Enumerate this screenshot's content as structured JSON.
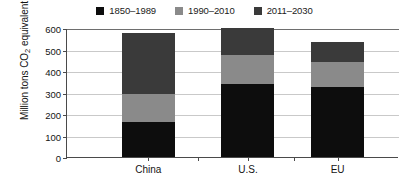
{
  "chart_data": {
    "type": "bar",
    "title": "",
    "subtitle": "",
    "xlabel": "",
    "ylabel": "Million tons CO2 equivalent",
    "ylabel_prefix": "Million tons CO",
    "ylabel_subscript": "2",
    "ylabel_suffix": " equivalent",
    "categories": [
      "China",
      "U.S.",
      "EU"
    ],
    "series": [
      {
        "name": "1850–1989",
        "color": "#0d0d0d",
        "values": [
          165,
          340,
          325
        ]
      },
      {
        "name": "1990–2010",
        "color": "#8a8a8a",
        "values": [
          130,
          135,
          115
        ]
      },
      {
        "name": "2011–2030",
        "color": "#3a3a3a",
        "values": [
          280,
          125,
          97
        ]
      }
    ],
    "totals": [
      575,
      600,
      537
    ],
    "stacked": true,
    "ylim": [
      0,
      600
    ],
    "yticks": [
      0,
      100,
      200,
      300,
      400,
      500,
      600
    ],
    "ytick_labels": [
      "0",
      "100",
      "200",
      "300",
      "400",
      "500",
      "600"
    ],
    "grid": true,
    "grid_axis": "y",
    "legend_position": "top-center",
    "legend": [
      "1850–1989",
      "1990–2010",
      "2011–2030"
    ],
    "colors": {
      "series_1": "#0d0d0d",
      "series_2": "#8a8a8a",
      "series_3": "#3a3a3a",
      "gridline": "#c9c9c9",
      "axis": "#4a4a4a",
      "text": "#141414",
      "background": "#ffffff"
    }
  }
}
